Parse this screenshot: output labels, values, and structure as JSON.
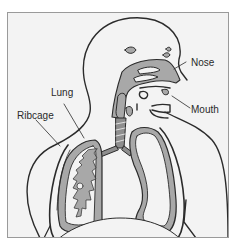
{
  "diagram": {
    "type": "anatomical illustration",
    "labels": [
      {
        "id": "nose",
        "text": "Nose"
      },
      {
        "id": "mouth",
        "text": "Mouth"
      },
      {
        "id": "lung",
        "text": "Lung"
      },
      {
        "id": "ribcage",
        "text": "Ribcage"
      }
    ],
    "colors": {
      "background": "#f3f3f3",
      "tissue": "#a8a8a8",
      "outline": "#2b2b2b",
      "frame": "#9a9a9a"
    }
  }
}
